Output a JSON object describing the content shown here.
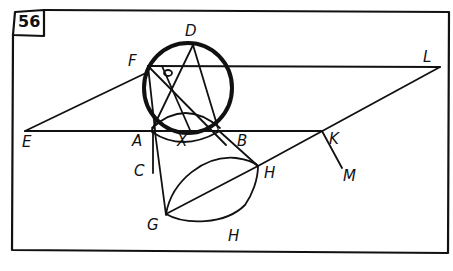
{
  "figure": {
    "number": "56",
    "ink_color": "#111111",
    "background": "#ffffff",
    "points": {
      "D": "D",
      "F": "F",
      "O": "o",
      "A": "A",
      "X": "X",
      "B": "B",
      "E": "E",
      "L": "L",
      "K": "K",
      "M": "M",
      "C": "C",
      "G": "G",
      "H_upper": "H",
      "H_lower": "H"
    },
    "elements": [
      "frame rectangle",
      "numbered box 56",
      "circle through D, F, A, B (thick)",
      "plane parallelogram E-F-L-K (lines EF, FL, LK, EK)",
      "chords F-B, D-A, D-X, F-A",
      "semi-ellipse arc A-X-B",
      "line A-C",
      "line A-G",
      "line B-H",
      "lens G-H with chord G-H",
      "line K-M"
    ]
  }
}
